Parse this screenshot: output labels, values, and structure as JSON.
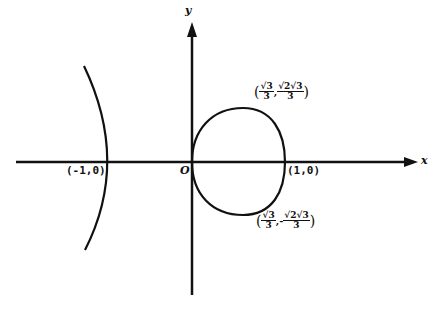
{
  "figure": {
    "axes": {
      "x_label": "x",
      "y_label": "y",
      "origin_label": "O"
    },
    "points": {
      "left_vertex": "(-1,0)",
      "right_vertex": "(1,0)",
      "upper_point": {
        "x_num": "√3",
        "x_den": "3",
        "y_sign": "",
        "y_num": "√2√3",
        "y_den": "3"
      },
      "lower_point": {
        "x_num": "√3",
        "x_den": "3",
        "y_sign": "-",
        "y_num": "√2√3",
        "y_den": "3"
      }
    },
    "curves": [
      {
        "name": "left-branch",
        "description": "open branch through (-1,0)"
      },
      {
        "name": "loop",
        "description": "closed loop from origin O to (1,0)"
      }
    ],
    "colors": {
      "ink": "#111111",
      "background": "#ffffff"
    }
  }
}
